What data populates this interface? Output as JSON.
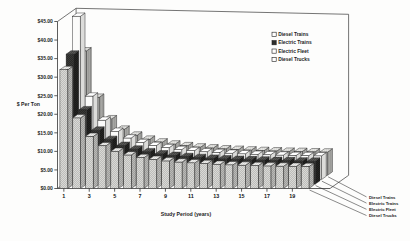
{
  "chart_data": {
    "type": "bar",
    "title": "",
    "xlabel": "Study Period (years)",
    "ylabel": "$ Per Ton",
    "ylim": [
      0,
      45
    ],
    "ytick_values": [
      0,
      5,
      10,
      15,
      20,
      25,
      30,
      35,
      40,
      45
    ],
    "ytick_labels": [
      "$0.00",
      "$5.00",
      "$10.00",
      "$15.00",
      "$20.00",
      "$25.00",
      "$30.00",
      "$35.00",
      "$40.00",
      "$45.00"
    ],
    "xtick_labels": [
      "1",
      "3",
      "5",
      "7",
      "9",
      "11",
      "13",
      "15",
      "17",
      "19"
    ],
    "categories": [
      "1",
      "2",
      "3",
      "4",
      "5",
      "6",
      "7",
      "8",
      "9",
      "10",
      "11",
      "12",
      "13",
      "14",
      "15",
      "16",
      "17",
      "18",
      "19",
      "20"
    ],
    "grid": false,
    "legend_position": "top-right",
    "projection": "3d-grouped-columns",
    "series": [
      {
        "name": "Diesel Trains",
        "fill": "light-hatch",
        "values": [
          32.0,
          19.0,
          14.0,
          11.5,
          10.0,
          9.0,
          8.3,
          7.8,
          7.4,
          7.1,
          6.9,
          6.7,
          6.5,
          6.35,
          6.25,
          6.15,
          6.05,
          6.0,
          5.95,
          5.9
        ]
      },
      {
        "name": "Electric Trains",
        "fill": "dark-solid",
        "values": [
          35.0,
          20.0,
          14.5,
          12.0,
          10.4,
          9.4,
          8.7,
          8.1,
          7.7,
          7.4,
          7.15,
          6.95,
          6.8,
          6.65,
          6.55,
          6.45,
          6.35,
          6.3,
          6.2,
          6.15
        ]
      },
      {
        "name": "Electric Fleet",
        "fill": "white-plain",
        "values": [
          44.0,
          22.5,
          16.0,
          13.0,
          11.2,
          10.0,
          9.2,
          8.6,
          8.1,
          7.8,
          7.5,
          7.3,
          7.1,
          6.95,
          6.8,
          6.7,
          6.6,
          6.5,
          6.45,
          6.4
        ]
      },
      {
        "name": "Diesel Trucks",
        "fill": "mid-hatch",
        "values": [
          33.5,
          21.0,
          15.2,
          12.4,
          10.8,
          9.7,
          8.95,
          8.4,
          7.95,
          7.6,
          7.35,
          7.1,
          6.95,
          6.8,
          6.65,
          6.55,
          6.45,
          6.4,
          6.3,
          6.25
        ]
      }
    ],
    "legend_entries": [
      "Diesel Trains",
      "Electric Trains",
      "Electric Fleet",
      "Diesel Trucks"
    ],
    "side_labels": [
      "Diesel Trains",
      "Electric Trains",
      "Electric Fleet",
      "Diesel Trucks"
    ]
  }
}
